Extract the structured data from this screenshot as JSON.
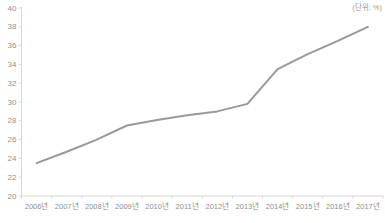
{
  "chart_data": {
    "type": "line",
    "unit_label": "(단위: %)",
    "categories": [
      "2006년",
      "2007년",
      "2008년",
      "2009년",
      "2010년",
      "2011년",
      "2012년",
      "2013년",
      "2014년",
      "2015년",
      "2016년",
      "2017년"
    ],
    "values": [
      23.5,
      24.7,
      26.0,
      27.5,
      28.1,
      28.6,
      29.0,
      29.8,
      33.5,
      35.1,
      36.5,
      38.0
    ],
    "y_tick_labels": [
      "20",
      "22",
      "24",
      "26",
      "28",
      "30",
      "32",
      "34",
      "36",
      "38",
      "40"
    ],
    "ylim": [
      20,
      40
    ],
    "y_tick_step": 2,
    "title": "",
    "xlabel": "",
    "ylabel": "",
    "grid": "off",
    "legend": "none",
    "line_color": "#999999",
    "axis_color": "#d8d8d8",
    "label_color": "#8f8f8f"
  }
}
